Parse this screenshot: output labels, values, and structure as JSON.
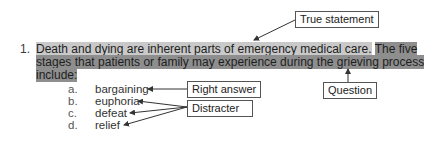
{
  "question": {
    "number": "1.",
    "true_statement_text": "Death and dying are inherent parts of emergency medical care.",
    "question_text_line1": "The five",
    "question_text_line2": "stages that patients or family may experience during the grieving process",
    "question_text_line3": "include:"
  },
  "options": [
    {
      "letter": "a.",
      "text": "bargaining"
    },
    {
      "letter": "b.",
      "text": "euphoria"
    },
    {
      "letter": "c.",
      "text": "defeat"
    },
    {
      "letter": "d.",
      "text": "relief"
    }
  ],
  "annotations": {
    "true_statement": "True statement",
    "question": "Question",
    "right_answer": "Right answer",
    "distracter": "Distracter"
  },
  "colors": {
    "true_statement_highlight": "#c9c9c9",
    "question_highlight": "#8e8e8e",
    "arrow": "#333333"
  }
}
